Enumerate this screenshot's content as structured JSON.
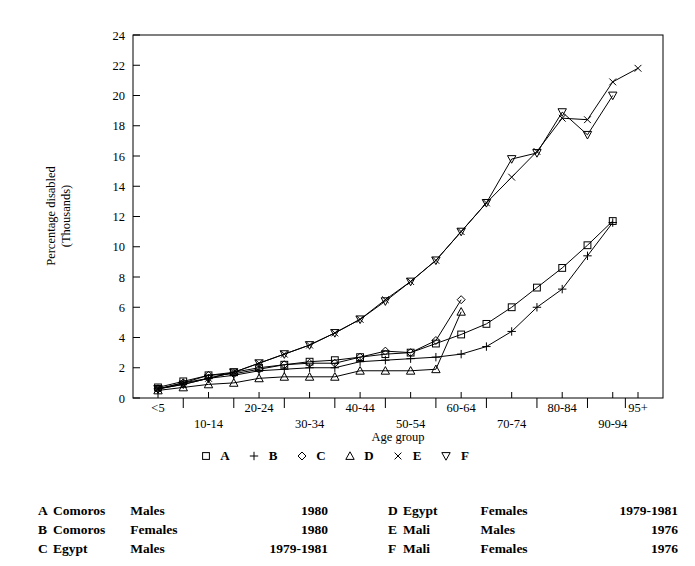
{
  "chart_data": {
    "type": "line",
    "title": "",
    "xlabel": "Age group",
    "ylabel": "Percentage disabled\n(Thousands)",
    "ylabel_line1": "Percentage disabled",
    "ylabel_line2": "(Thousands)",
    "ylim": [
      0,
      24
    ],
    "yticks": [
      0,
      2,
      4,
      6,
      8,
      10,
      12,
      14,
      16,
      18,
      20,
      22,
      24
    ],
    "grid": false,
    "legend_position": "below-axis",
    "categories": [
      "<5",
      "5-9",
      "10-14",
      "15-19",
      "20-24",
      "25-29",
      "30-34",
      "35-39",
      "40-44",
      "45-49",
      "50-54",
      "55-59",
      "60-64",
      "65-69",
      "70-74",
      "75-79",
      "80-84",
      "85-89",
      "90-94",
      "95+"
    ],
    "xticks_shown": [
      "<5",
      "10-14",
      "20-24",
      "30-34",
      "40-44",
      "50-54",
      "60-64",
      "70-74",
      "80-84",
      "90-94",
      "95+"
    ],
    "series": [
      {
        "name": "A",
        "marker": "square",
        "label": "A",
        "values": [
          0.7,
          1.1,
          1.5,
          1.7,
          2.0,
          2.2,
          2.4,
          2.5,
          2.7,
          2.9,
          3.0,
          3.6,
          4.2,
          4.9,
          6.0,
          7.3,
          8.6,
          10.1,
          11.7,
          null
        ]
      },
      {
        "name": "B",
        "marker": "plus",
        "label": "B",
        "values": [
          0.6,
          1.0,
          1.3,
          1.5,
          1.8,
          1.9,
          2.0,
          2.0,
          2.4,
          2.5,
          2.6,
          2.7,
          2.9,
          3.4,
          4.4,
          6.0,
          7.2,
          9.4,
          11.6,
          null
        ]
      },
      {
        "name": "C",
        "marker": "diamond",
        "label": "C",
        "values": [
          0.6,
          1.0,
          1.5,
          1.6,
          1.9,
          2.2,
          2.3,
          2.3,
          2.7,
          3.1,
          3.0,
          3.8,
          6.5,
          null,
          null,
          null,
          null,
          null,
          null,
          null
        ]
      },
      {
        "name": "D",
        "marker": "triangle-up",
        "label": "D",
        "values": [
          0.5,
          0.7,
          0.9,
          1.0,
          1.3,
          1.4,
          1.4,
          1.4,
          1.8,
          1.8,
          1.8,
          1.9,
          5.7,
          null,
          null,
          null,
          null,
          null,
          null,
          null
        ]
      },
      {
        "name": "E",
        "marker": "cross",
        "label": "E",
        "values": [
          0.6,
          0.9,
          1.3,
          1.7,
          2.3,
          2.9,
          3.5,
          4.3,
          5.2,
          6.5,
          7.7,
          9.1,
          11.0,
          12.9,
          14.6,
          16.3,
          18.5,
          18.4,
          20.9,
          21.8
        ]
      },
      {
        "name": "F",
        "marker": "triangle-down",
        "label": "F",
        "values": [
          0.6,
          0.9,
          1.3,
          1.7,
          2.3,
          2.9,
          3.5,
          4.3,
          5.2,
          6.4,
          7.7,
          9.1,
          11.0,
          12.9,
          15.8,
          16.2,
          18.9,
          17.4,
          20.0,
          null
        ]
      }
    ]
  },
  "axis": {
    "x_title": "Age group",
    "y_title_line1": "Percentage disabled",
    "y_title_line2": "(Thousands)"
  },
  "legend": {
    "entries": [
      {
        "marker": "square",
        "label": "A"
      },
      {
        "marker": "plus",
        "label": "B"
      },
      {
        "marker": "diamond",
        "label": "C"
      },
      {
        "marker": "triangle-up",
        "label": "D"
      },
      {
        "marker": "cross",
        "label": "E"
      },
      {
        "marker": "triangle-down",
        "label": "F"
      }
    ]
  },
  "notes": {
    "left": [
      {
        "key": "A",
        "country": "Comoros",
        "sex": "Males",
        "years": "1980"
      },
      {
        "key": "B",
        "country": "Comoros",
        "sex": "Females",
        "years": "1980"
      },
      {
        "key": "C",
        "country": "Egypt",
        "sex": "Males",
        "years": "1979-1981"
      }
    ],
    "right": [
      {
        "key": "D",
        "country": "Egypt",
        "sex": "Females",
        "years": "1979-1981"
      },
      {
        "key": "E",
        "country": "Mali",
        "sex": "Males",
        "years": "1976"
      },
      {
        "key": "F",
        "country": "Mali",
        "sex": "Females",
        "years": "1976"
      }
    ]
  },
  "colors": {
    "ink": "#000000",
    "background": "#ffffff"
  }
}
